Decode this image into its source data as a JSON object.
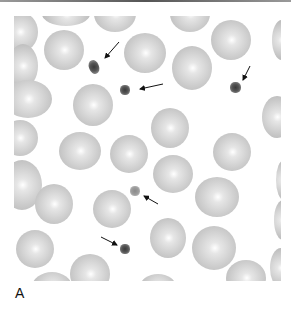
{
  "figure": {
    "panel_label": "A",
    "annotations": [
      {
        "type": "arrow",
        "target": "platelet"
      },
      {
        "type": "arrow",
        "target": "platelet"
      },
      {
        "type": "arrow",
        "target": "platelet"
      },
      {
        "type": "arrow",
        "target": "platelet"
      },
      {
        "type": "arrow",
        "target": "platelet"
      }
    ],
    "colors": {
      "background": "#ffffff",
      "rbc": "#c8c8c8",
      "platelet": "#444444",
      "arrow": "#111111"
    }
  }
}
